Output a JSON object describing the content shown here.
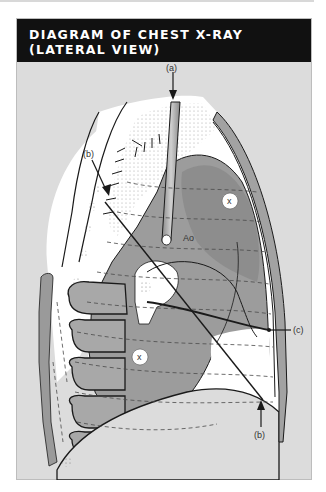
{
  "figure": {
    "title_line1": "DIAGRAM OF CHEST X-RAY",
    "title_line2": "(LATERAL VIEW)"
  },
  "labels": {
    "a": "(a)",
    "b_top": "(b)",
    "b_bottom": "(b)",
    "c": "(c)",
    "aorta": "Ao",
    "x_upper": "x",
    "x_lower": "x"
  },
  "colors": {
    "header_bg": "#111111",
    "header_text": "#ffffff",
    "panel_bg": "#dcdcdc",
    "lung_white": "#ffffff",
    "tissue_gray": "#9a9a9a",
    "tissue_mid": "#b4b4b4",
    "outline": "#1a1a1a"
  }
}
